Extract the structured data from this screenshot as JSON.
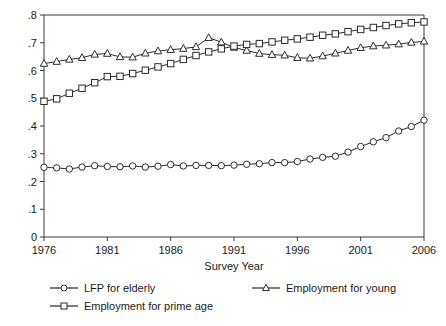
{
  "chart_data": {
    "type": "line",
    "title": "",
    "xlabel": "Survey Year",
    "ylabel": "",
    "xlim": [
      1976,
      2006
    ],
    "ylim": [
      0,
      0.8
    ],
    "grid": false,
    "legend_position": "bottom",
    "x_ticks": [
      "1976",
      "1981",
      "1986",
      "1991",
      "1996",
      "2001",
      "2006"
    ],
    "x_tick_values": [
      1976,
      1981,
      1986,
      1991,
      1996,
      2001,
      2006
    ],
    "y_ticks": [
      "0",
      ".1",
      ".2",
      ".3",
      ".4",
      ".5",
      ".6",
      ".7",
      ".8"
    ],
    "y_tick_values": [
      0,
      0.1,
      0.2,
      0.3,
      0.4,
      0.5,
      0.6,
      0.7,
      0.8
    ],
    "x": [
      1976,
      1977,
      1978,
      1979,
      1980,
      1981,
      1982,
      1983,
      1984,
      1985,
      1986,
      1987,
      1988,
      1989,
      1990,
      1991,
      1992,
      1993,
      1994,
      1995,
      1996,
      1997,
      1998,
      1999,
      2000,
      2001,
      2002,
      2003,
      2004,
      2005,
      2006
    ],
    "series": [
      {
        "name": "LFP for elderly",
        "marker": "circle",
        "values": [
          0.251,
          0.249,
          0.245,
          0.252,
          0.257,
          0.254,
          0.253,
          0.256,
          0.252,
          0.255,
          0.261,
          0.256,
          0.258,
          0.258,
          0.257,
          0.259,
          0.262,
          0.264,
          0.268,
          0.268,
          0.272,
          0.281,
          0.287,
          0.291,
          0.306,
          0.326,
          0.343,
          0.358,
          0.382,
          0.398,
          0.421
        ]
      },
      {
        "name": "Employment for young",
        "marker": "triangle",
        "values": [
          0.625,
          0.632,
          0.64,
          0.646,
          0.658,
          0.661,
          0.649,
          0.648,
          0.662,
          0.67,
          0.675,
          0.679,
          0.685,
          0.718,
          0.702,
          0.683,
          0.672,
          0.661,
          0.657,
          0.655,
          0.646,
          0.644,
          0.652,
          0.662,
          0.672,
          0.682,
          0.688,
          0.691,
          0.695,
          0.701,
          0.705
        ]
      },
      {
        "name": "Employment for prime age",
        "marker": "square",
        "values": [
          0.489,
          0.498,
          0.518,
          0.536,
          0.556,
          0.578,
          0.579,
          0.589,
          0.601,
          0.613,
          0.625,
          0.64,
          0.654,
          0.667,
          0.678,
          0.688,
          0.694,
          0.697,
          0.703,
          0.709,
          0.714,
          0.72,
          0.727,
          0.732,
          0.74,
          0.748,
          0.755,
          0.762,
          0.768,
          0.772,
          0.775
        ]
      }
    ]
  },
  "legend": {
    "entries": [
      {
        "label": "LFP for elderly",
        "marker": "circle"
      },
      {
        "label": "Employment for young",
        "marker": "triangle"
      },
      {
        "label": "Employment for prime age",
        "marker": "square"
      }
    ]
  },
  "colors": {
    "line": "#2b2b2b",
    "axis": "#3a3a3a",
    "marker_fill": "#ffffff",
    "background": "#ffffff"
  }
}
